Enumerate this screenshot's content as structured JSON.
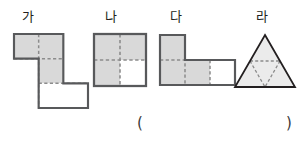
{
  "page": {
    "background_color": "#ffffff",
    "width": 306,
    "height": 143
  },
  "style_tokens": {
    "shaded_fill": "#d9d9d9",
    "unshaded_fill": "#ffffff",
    "outline_color": "#58595b",
    "inner_dash_color": "#808080",
    "label_color": "#231f20",
    "triangle_fill": "#ebebeb",
    "triangle_outline": "#231f20"
  },
  "figures": [
    {
      "key": "ga",
      "label": "가",
      "type": "grid-polyomino",
      "cell_size": 23,
      "cells": [
        {
          "col": 0,
          "row": 0,
          "shaded": true
        },
        {
          "col": 1,
          "row": 0,
          "shaded": true
        },
        {
          "col": 1,
          "row": 1,
          "shaded": true
        },
        {
          "col": 1,
          "row": 2,
          "shaded": false
        },
        {
          "col": 2,
          "row": 2,
          "shaded": false
        }
      ],
      "shaded_count": 3,
      "unshaded_count": 2,
      "total_cells": 5
    },
    {
      "key": "na",
      "label": "나",
      "type": "grid-polyomino",
      "cell_size": 23,
      "cells": [
        {
          "col": 0,
          "row": 0,
          "shaded": true
        },
        {
          "col": 1,
          "row": 0,
          "shaded": true
        },
        {
          "col": 0,
          "row": 1,
          "shaded": true
        },
        {
          "col": 1,
          "row": 1,
          "shaded": false
        }
      ],
      "shaded_count": 3,
      "unshaded_count": 1,
      "total_cells": 4
    },
    {
      "key": "da",
      "label": "다",
      "type": "grid-polyomino",
      "cell_size": 23,
      "cells": [
        {
          "col": 0,
          "row": 0,
          "shaded": true
        },
        {
          "col": 0,
          "row": 1,
          "shaded": true
        },
        {
          "col": 1,
          "row": 1,
          "shaded": true
        },
        {
          "col": 2,
          "row": 1,
          "shaded": false
        }
      ],
      "shaded_count": 3,
      "unshaded_count": 1,
      "total_cells": 4
    },
    {
      "key": "ra",
      "label": "라",
      "type": "triangle-subdivided",
      "subdivisions": 4,
      "shaded_count": 3,
      "unshaded_count": 1,
      "total_cells": 4
    }
  ],
  "answer": {
    "open_paren": "(",
    "close_paren": ")",
    "value": ""
  }
}
